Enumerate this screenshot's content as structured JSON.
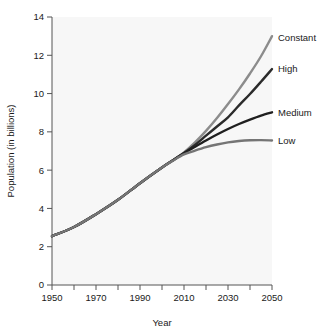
{
  "chart_data": {
    "type": "line",
    "title": "",
    "xlabel": "Year",
    "ylabel": "Population (in billions)",
    "xlim": [
      1950,
      2050
    ],
    "ylim": [
      0,
      14
    ],
    "grid": false,
    "legend_position": "right-of-line-ends",
    "x_major_ticks": [
      1950,
      1970,
      1990,
      2010,
      2030,
      2050
    ],
    "x_minor_ticks": [
      1960,
      1980,
      2000,
      2020,
      2040
    ],
    "x_tick_labels": [
      "1950",
      "1970",
      "1990",
      "2010",
      "2030",
      "2050"
    ],
    "y_ticks": [
      0,
      2,
      4,
      6,
      8,
      10,
      12,
      14
    ],
    "y_tick_labels": [
      "0",
      "2",
      "4",
      "6",
      "8",
      "10",
      "12",
      "14"
    ],
    "x": [
      1950,
      1960,
      1970,
      1980,
      1990,
      2000,
      2005,
      2010,
      2015,
      2020,
      2025,
      2030,
      2035,
      2040,
      2045,
      2050
    ],
    "series": [
      {
        "name": "Constant",
        "label": "Constant",
        "color": "#8c8c8c",
        "label_y_value": 12.95,
        "values": [
          2.55,
          3.03,
          3.7,
          4.45,
          5.32,
          6.14,
          6.52,
          6.93,
          7.45,
          8.05,
          8.72,
          9.45,
          10.22,
          11.05,
          11.95,
          13.0
        ]
      },
      {
        "name": "High",
        "label": "High",
        "color": "#2b2b2b",
        "label_y_value": 11.28,
        "values": [
          2.55,
          3.03,
          3.7,
          4.45,
          5.32,
          6.14,
          6.52,
          6.9,
          7.32,
          7.8,
          8.28,
          8.76,
          9.38,
          9.98,
          10.62,
          11.28
        ]
      },
      {
        "name": "Medium",
        "label": "Medium",
        "color": "#1f1f1f",
        "label_y_value": 9.02,
        "values": [
          2.55,
          3.03,
          3.7,
          4.45,
          5.32,
          6.14,
          6.52,
          6.88,
          7.22,
          7.55,
          7.86,
          8.15,
          8.41,
          8.64,
          8.85,
          9.02
        ]
      },
      {
        "name": "Low",
        "label": "Low",
        "color": "#757575",
        "label_y_value": 7.55,
        "values": [
          2.55,
          3.03,
          3.7,
          4.45,
          5.32,
          6.14,
          6.5,
          6.82,
          7.02,
          7.2,
          7.34,
          7.45,
          7.52,
          7.56,
          7.57,
          7.55
        ]
      }
    ]
  },
  "axes": {
    "x_axis_title": "Year",
    "y_axis_title": "Population (in billions)"
  },
  "colors": {
    "plot_background": "#f7f7f7",
    "page_background": "#ffffff",
    "axis": "#555555",
    "text": "#1a1a1a"
  }
}
